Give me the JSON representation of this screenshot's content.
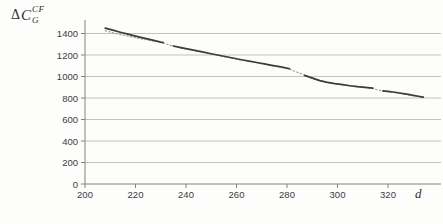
{
  "figure": {
    "y_axis_label": {
      "delta": "Δ",
      "symbol": "C",
      "sup": "CF",
      "sub": "G"
    },
    "x_axis_label": "d"
  },
  "chart_data": {
    "type": "line",
    "title": "",
    "xlabel": "d",
    "ylabel": "ΔC_G^CF",
    "xlim": [
      200,
      336
    ],
    "ylim": [
      0,
      1500
    ],
    "x_ticks": [
      200,
      220,
      240,
      260,
      280,
      300,
      320
    ],
    "y_ticks": [
      0,
      200,
      400,
      600,
      800,
      1000,
      1200,
      1400
    ],
    "grid": "horizontal-only",
    "legend": "none",
    "jumps_at_x": [
      231,
      284,
      316
    ],
    "colors": {
      "solid_series": "#3d3d3d",
      "dotted_series": "#98948c",
      "gridline": "#c6c2ba",
      "axis": "#85827c",
      "tick_label": "#3c3c3c"
    },
    "series": [
      {
        "name": "solid-with-jumps",
        "style": "solid",
        "segments": [
          [
            [
              208,
              1450
            ],
            [
              211,
              1431
            ],
            [
              214,
              1412
            ],
            [
              217,
              1394
            ],
            [
              220,
              1376
            ],
            [
              223,
              1359
            ],
            [
              226,
              1343
            ],
            [
              228,
              1332
            ],
            [
              230,
              1320
            ],
            [
              231,
              1315
            ]
          ],
          [
            [
              235,
              1284
            ],
            [
              238,
              1269
            ],
            [
              241,
              1254
            ],
            [
              244,
              1240
            ],
            [
              247,
              1226
            ],
            [
              250,
              1212
            ],
            [
              253,
              1198
            ],
            [
              256,
              1184
            ],
            [
              259,
              1170
            ],
            [
              262,
              1156
            ],
            [
              265,
              1143
            ],
            [
              268,
              1130
            ],
            [
              271,
              1117
            ],
            [
              274,
              1104
            ],
            [
              277,
              1092
            ],
            [
              279,
              1083
            ],
            [
              281,
              1072
            ]
          ],
          [
            [
              287,
              1010
            ],
            [
              289,
              994
            ],
            [
              291,
              978
            ],
            [
              293,
              962
            ],
            [
              296,
              946
            ],
            [
              299,
              934
            ],
            [
              302,
              925
            ],
            [
              305,
              914
            ],
            [
              308,
              905
            ],
            [
              311,
              898
            ],
            [
              314,
              892
            ]
          ],
          [
            [
              318,
              866
            ],
            [
              320,
              861
            ],
            [
              322,
              856
            ],
            [
              324,
              849
            ],
            [
              326,
              841
            ],
            [
              328,
              833
            ],
            [
              330,
              824
            ],
            [
              332,
              816
            ],
            [
              334,
              808
            ]
          ]
        ]
      },
      {
        "name": "dotted-reference",
        "style": "dotted",
        "points": [
          [
            208,
            1426
          ],
          [
            211,
            1407
          ],
          [
            214,
            1391
          ],
          [
            217,
            1376
          ],
          [
            220,
            1361
          ],
          [
            223,
            1347
          ],
          [
            226,
            1334
          ],
          [
            229,
            1322
          ],
          [
            231,
            1311
          ],
          [
            233,
            1297
          ],
          [
            235,
            1280
          ],
          [
            238,
            1264
          ],
          [
            242,
            1246
          ],
          [
            246,
            1228
          ],
          [
            250,
            1208
          ],
          [
            254,
            1191
          ],
          [
            258,
            1172
          ],
          [
            262,
            1152
          ],
          [
            266,
            1139
          ],
          [
            270,
            1120
          ],
          [
            274,
            1100
          ],
          [
            278,
            1086
          ],
          [
            281,
            1068
          ],
          [
            282,
            1058
          ],
          [
            284,
            1040
          ],
          [
            286,
            1022
          ],
          [
            288,
            1000
          ],
          [
            291,
            973
          ],
          [
            294,
            955
          ],
          [
            297,
            940
          ],
          [
            300,
            929
          ],
          [
            303,
            919
          ],
          [
            306,
            909
          ],
          [
            309,
            900
          ],
          [
            312,
            894
          ],
          [
            314,
            888
          ],
          [
            315,
            882
          ],
          [
            316,
            875
          ],
          [
            317,
            869
          ],
          [
            319,
            860
          ],
          [
            322,
            852
          ],
          [
            325,
            843
          ],
          [
            328,
            829
          ],
          [
            331,
            818
          ],
          [
            334,
            804
          ]
        ]
      }
    ]
  }
}
